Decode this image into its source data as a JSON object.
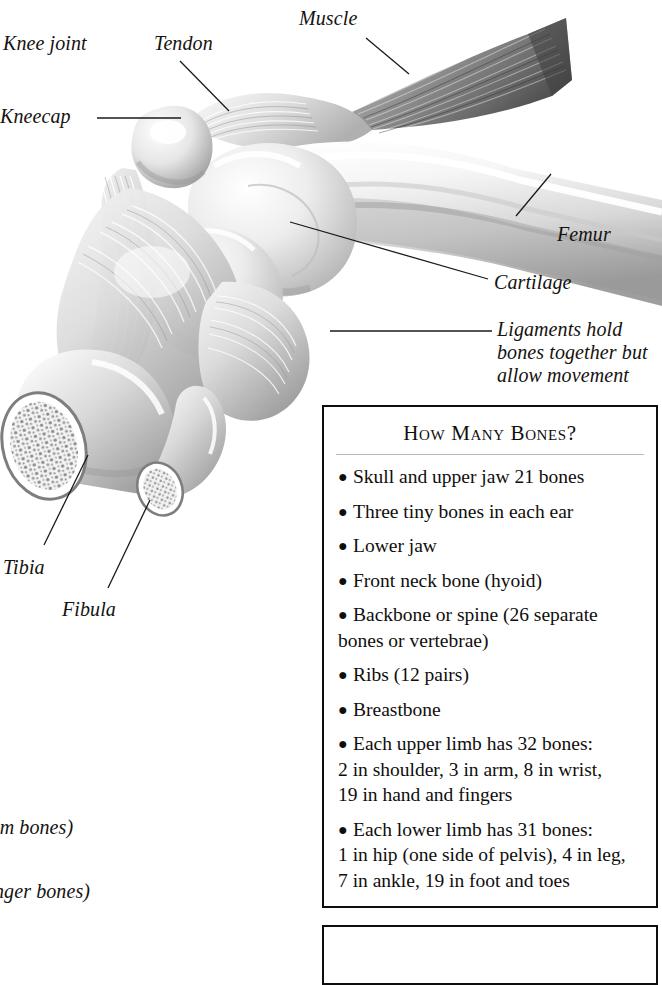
{
  "page": {
    "kind": "anatomy-textbook-page"
  },
  "labels": [
    {
      "id": "knee-joint",
      "text": "Knee joint"
    },
    {
      "id": "tendon",
      "text": "Tendon"
    },
    {
      "id": "muscle",
      "text": "Muscle"
    },
    {
      "id": "kneecap",
      "text": "Kneecap"
    },
    {
      "id": "femur",
      "text": "Femur"
    },
    {
      "id": "cartilage",
      "text": "Cartilage"
    },
    {
      "id": "ligaments",
      "text": "Ligaments hold bones together but allow movement"
    },
    {
      "id": "tibia",
      "text": "Tibia"
    },
    {
      "id": "fibula",
      "text": "Fibula"
    },
    {
      "id": "palm",
      "text": "lm bones)"
    },
    {
      "id": "finger",
      "text": "nger bones)"
    }
  ],
  "bones_box": {
    "title": "How Many Bones?",
    "bullet_glyph": "●",
    "items": [
      {
        "line1": "Skull and upper jaw 21 bones"
      },
      {
        "line1": "Three tiny bones in each ear"
      },
      {
        "line1": "Lower jaw"
      },
      {
        "line1": "Front neck bone (hyoid)"
      },
      {
        "line1": "Backbone or spine (26 separate",
        "line2": "bones or vertebrae)"
      },
      {
        "line1": "Ribs (12 pairs)"
      },
      {
        "line1": "Breastbone"
      },
      {
        "line1": "Each upper limb has 32 bones:",
        "line2": " 2 in shoulder, 3 in arm, 8 in wrist,",
        "line3": "19 in hand and fingers"
      },
      {
        "line1": "Each lower limb has 31 bones:",
        "line2": "1 in hip (one side of pelvis), 4 in leg,",
        "line3": "7 in ankle, 19 in foot and toes"
      }
    ]
  },
  "second_box": {
    "content": ""
  },
  "colors": {
    "page_background": "#ffffff",
    "text": "#100e0c",
    "border": "#0d0d0d",
    "rule": "#b9b9b9",
    "leader_line": "#1a1a1a"
  }
}
